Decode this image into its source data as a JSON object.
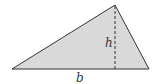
{
  "diagram": {
    "type": "triangle-area",
    "labels": {
      "height": "h",
      "base": "b"
    },
    "colors": {
      "fill": "#d9d9d9",
      "stroke": "#333333",
      "background": "#ffffff"
    },
    "vertices": {
      "left": [
        12,
        69
      ],
      "apex": [
        115,
        5
      ],
      "right": [
        149,
        69
      ]
    }
  }
}
